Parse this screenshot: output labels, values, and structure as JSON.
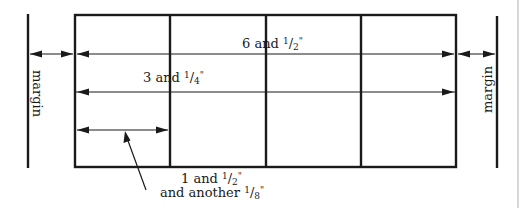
{
  "diagram": {
    "grid": {
      "columns": 4,
      "rows": 2
    },
    "labels": {
      "margin_left": "margin",
      "margin_right": "margin",
      "full_width": {
        "whole": "6 and ",
        "num": "1",
        "den": "2",
        "unit": "\""
      },
      "half_width": {
        "whole": "3 and ",
        "num": "1",
        "den": "4",
        "unit": "\""
      },
      "column_width_line1": {
        "whole": "1 and ",
        "num": "1",
        "den": "2",
        "unit": "\""
      },
      "column_width_line2": {
        "whole": "and another ",
        "num": "1",
        "den": "8",
        "unit": "\""
      }
    },
    "measurements": [
      {
        "name": "full-width",
        "value_inches": 6.5
      },
      {
        "name": "half-width",
        "value_inches": 3.25
      },
      {
        "name": "column-width",
        "value_inches": 1.625
      }
    ]
  }
}
